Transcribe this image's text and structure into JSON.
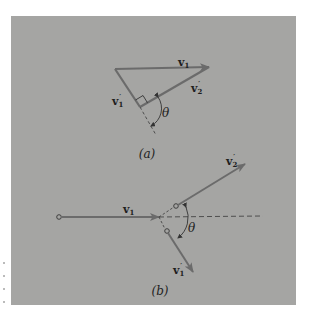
{
  "figure": {
    "background_color": "#a5a5a3",
    "arrow_color": "#6b6b6b",
    "line_color": "#555555",
    "text_color": "#1e1e1e",
    "part_a": {
      "caption": "(a)",
      "vectors": {
        "v1": {
          "symbol": "v",
          "subscript": "1",
          "prime": ""
        },
        "v2_prime": {
          "symbol": "v",
          "subscript": "2",
          "prime": "′"
        },
        "v1_prime": {
          "symbol": "v",
          "subscript": "1",
          "prime": "′"
        }
      },
      "angle_label": "θ",
      "right_angle_marker": true
    },
    "part_b": {
      "caption": "(b)",
      "vectors": {
        "v1": {
          "symbol": "v",
          "subscript": "1",
          "prime": ""
        },
        "v2_prime": {
          "symbol": "v",
          "subscript": "2",
          "prime": "′"
        },
        "v1_prime": {
          "symbol": "v",
          "subscript": "1",
          "prime": "′"
        }
      },
      "angle_label": "θ"
    }
  }
}
